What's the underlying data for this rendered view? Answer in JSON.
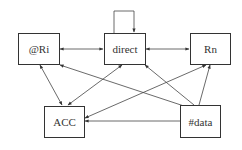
{
  "diagram": {
    "nodes": [
      {
        "id": "ri",
        "label": "@Ri"
      },
      {
        "id": "direct",
        "label": "direct"
      },
      {
        "id": "rn",
        "label": "Rn"
      },
      {
        "id": "acc",
        "label": "ACC"
      },
      {
        "id": "data",
        "label": "#data"
      }
    ],
    "edges": [
      {
        "from": "direct",
        "to": "direct",
        "type": "self-loop"
      },
      {
        "from": "ri",
        "to": "direct",
        "type": "bidirectional"
      },
      {
        "from": "direct",
        "to": "rn",
        "type": "bidirectional"
      },
      {
        "from": "ri",
        "to": "acc",
        "type": "bidirectional"
      },
      {
        "from": "direct",
        "to": "acc",
        "type": "bidirectional"
      },
      {
        "from": "rn",
        "to": "acc",
        "type": "bidirectional"
      },
      {
        "from": "data",
        "to": "ri",
        "type": "directed"
      },
      {
        "from": "data",
        "to": "direct",
        "type": "directed"
      },
      {
        "from": "data",
        "to": "rn",
        "type": "directed"
      },
      {
        "from": "data",
        "to": "acc",
        "type": "directed"
      }
    ]
  }
}
